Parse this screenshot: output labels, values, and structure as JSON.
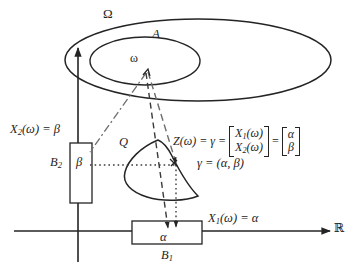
{
  "figure": {
    "width": 353,
    "height": 270,
    "stroke_color": "#242424",
    "background": "#ffffff"
  },
  "sample_space": {
    "omega_label": "Ω",
    "event_label": "A",
    "outcome_label": "ω"
  },
  "axes": {
    "horizontal_end_label": "ℝ",
    "x1_label": "X",
    "x1_sub": "1",
    "x1_rest": "(ω) = α",
    "x2_label": "X",
    "x2_sub": "2",
    "x2_rest": "(ω) = β"
  },
  "borel_sets": {
    "b1_label": "B",
    "b1_sub": "1",
    "b1_value": "α",
    "b2_label": "B",
    "b2_sub": "2",
    "b2_value": "β"
  },
  "plane_region": {
    "q_label": "Q",
    "gamma_point_label": "γ = (α, β)"
  },
  "map_equation": {
    "lhs": "Z(ω) = γ =",
    "matrix1_top": "X",
    "matrix1_top_sub": "1",
    "matrix1_top_rest": "(ω)",
    "matrix1_bottom": "X",
    "matrix1_bottom_sub": "2",
    "matrix1_bottom_rest": "(ω)",
    "equals": "=",
    "matrix2_top": "α",
    "matrix2_bottom": "β"
  }
}
